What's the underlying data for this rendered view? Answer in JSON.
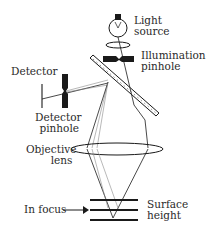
{
  "diagram": {
    "labels": {
      "light_source": [
        "Light",
        "source"
      ],
      "illumination_pinhole": [
        "Illumination",
        "pinhole"
      ],
      "detector": "Detector",
      "detector_pinhole": [
        "Detector",
        "pinhole"
      ],
      "objective_lens": [
        "Objective",
        "lens"
      ],
      "in_focus": "In focus",
      "surface_height": [
        "Surface",
        "height"
      ]
    },
    "colors": {
      "stroke": "#1a1a1a",
      "faint_ray": "#8a8a8a",
      "text": "#2a2a2a"
    }
  }
}
